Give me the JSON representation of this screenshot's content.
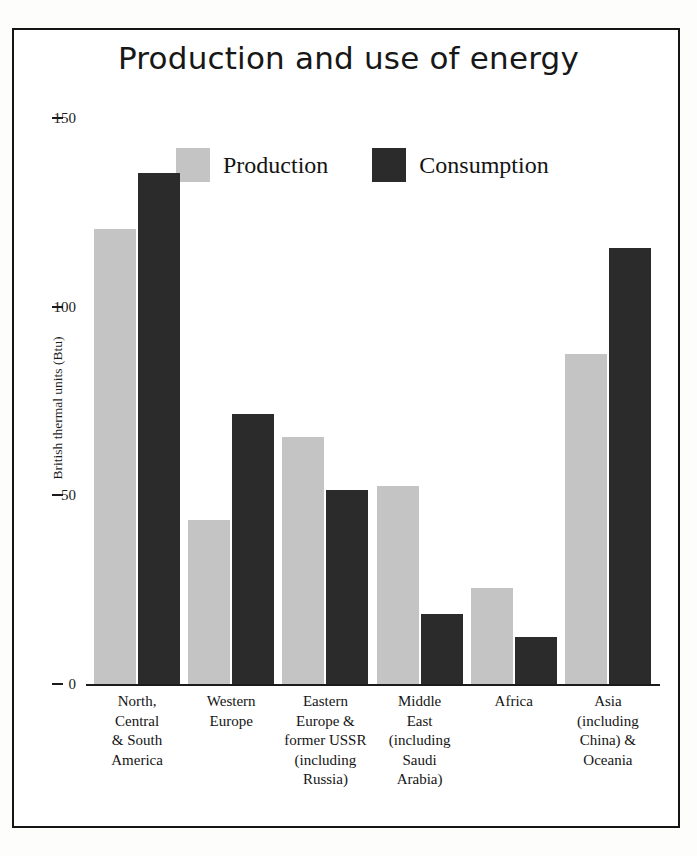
{
  "chart_data": {
    "type": "bar",
    "title": "Production and use of energy",
    "xlabel": "",
    "ylabel": "British thermal units (Btu)",
    "ylim": [
      0,
      150
    ],
    "yticks": [
      0,
      50,
      100,
      150
    ],
    "ytick_labels": [
      "0",
      "50",
      "100",
      "150"
    ],
    "grid": false,
    "legend_position": "top-center",
    "categories": [
      "North, Central & South America",
      "Western Europe",
      "Eastern Europe & former USSR (including Russia)",
      "Middle East (including Saudi Arabia)",
      "Africa",
      "Asia (including China) & Oceania"
    ],
    "category_lines": [
      [
        "North,",
        "Central",
        "& South",
        "America"
      ],
      [
        "Western",
        "Europe"
      ],
      [
        "Eastern",
        "Europe &",
        "former USSR",
        "(including",
        "Russia)"
      ],
      [
        "Middle",
        "East",
        "(including",
        "Saudi",
        "Arabia)"
      ],
      [
        "Africa"
      ],
      [
        "Asia",
        "(including",
        "China) &",
        "Oceania"
      ]
    ],
    "series": [
      {
        "name": "Production",
        "color": "#c4c4c4",
        "values": [
          121,
          44,
          66,
          53,
          26,
          88
        ]
      },
      {
        "name": "Consumption",
        "color": "#2b2b2b",
        "values": [
          136,
          72,
          52,
          19,
          13,
          116
        ]
      }
    ]
  },
  "legend": {
    "items": [
      {
        "label": "Production",
        "color": "#c4c4c4"
      },
      {
        "label": "Consumption",
        "color": "#2b2b2b"
      }
    ]
  },
  "axis": {
    "y_title": "British thermal units (Btu)",
    "ticks": [
      "150",
      "100",
      "50",
      "0"
    ]
  }
}
